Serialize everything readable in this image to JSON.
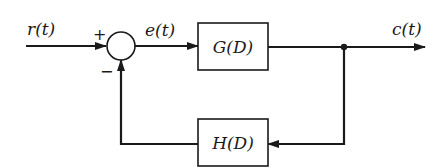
{
  "diagram": {
    "type": "feedback-control-block-diagram",
    "signals": {
      "input": "r(t)",
      "error": "e(t)",
      "output": "c(t)"
    },
    "summing_junction": {
      "plus_sign": "+",
      "minus_sign": "−"
    },
    "blocks": {
      "forward": "G(D)",
      "feedback": "H(D)"
    },
    "colors": {
      "line": "#1a1a1a",
      "background": "#ffffff"
    }
  }
}
